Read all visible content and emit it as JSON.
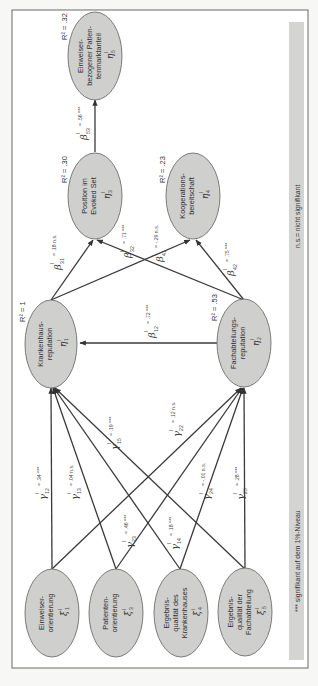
{
  "figure": {
    "orientation": "rotated-90-ccw",
    "legend": {
      "significance_note": "*** signifikant auf dem 1%-Niveau",
      "ns_note": "n.s.= nicht signifikant"
    },
    "nodes": {
      "xi1": {
        "line1": "Einweiser-",
        "line2": "orientierung",
        "line3": "",
        "symbol": "ξ",
        "sup": "l",
        "sub": "1"
      },
      "xi3": {
        "line1": "Patienten-",
        "line2": "orientierung",
        "line3": "",
        "symbol": "ξ",
        "sup": "l",
        "sub": "3"
      },
      "xi4": {
        "line1": "Ergebnis-",
        "line2": "qualität des",
        "line3": "Krankenhauses",
        "symbol": "ξ",
        "sup": "l",
        "sub": "4"
      },
      "xi5": {
        "line1": "Ergebnis-",
        "line2": "qualität der",
        "line3": "Fachabteilung",
        "symbol": "ξ",
        "sup": "l",
        "sub": "5"
      },
      "eta1": {
        "line1": "Krankenhaus-",
        "line2": "reputation",
        "symbol": "η",
        "sup": "l",
        "sub": "1",
        "r2": "R² = 1"
      },
      "eta2": {
        "line1": "Fachabteilungs-",
        "line2": "reputation",
        "symbol": "η",
        "sup": "l",
        "sub": "2",
        "r2": "R² = .53"
      },
      "eta3": {
        "line1": "Position im",
        "line2": "Evoked Set",
        "symbol": "η",
        "sup": "l",
        "sub": "3",
        "r2": "R² = .30"
      },
      "eta4": {
        "line1": "Kooperations-",
        "line2": "bereitschaft",
        "symbol": "η",
        "sup": "l",
        "sub": "4",
        "r2": "R² = .23"
      },
      "eta5": {
        "line1": "Einweiser-",
        "line2": "bezogener Patien-",
        "line3": "tenmarktanteil",
        "symbol": "η",
        "sup": "l",
        "sub": "5",
        "r2": "R² = .32"
      }
    },
    "paths": {
      "g12": {
        "sym": "γ",
        "sup": "l",
        "sub": "12",
        "value": "= .34 ***"
      },
      "g13": {
        "sym": "γ",
        "sup": "l",
        "sub": "13",
        "value": "= .04 n.s."
      },
      "g15": {
        "sym": "γ",
        "sup": "l",
        "sub": "15",
        "value": "= .19 ***"
      },
      "g23": {
        "sym": "γ",
        "sup": "l",
        "sub": "23",
        "value": "= .46 ***"
      },
      "g22": {
        "sym": "γ",
        "sup": "l",
        "sub": "22",
        "value": "= .12 n.s."
      },
      "g14": {
        "sym": "γ",
        "sup": "l",
        "sub": "14",
        "value": "= .18 ***"
      },
      "g24": {
        "sym": "γ",
        "sup": "l",
        "sub": "24",
        "value": "= -.01 n.s."
      },
      "g25": {
        "sym": "γ",
        "sup": "l",
        "sub": "25",
        "value": "= .28 ***"
      },
      "b12": {
        "sym": "β",
        "sup": "l",
        "sub": "12",
        "value": "= .72 ***"
      },
      "b31": {
        "sym": "β",
        "sup": "l",
        "sub": "31",
        "value": "= .18 n.s."
      },
      "b32": {
        "sym": "β",
        "sup": "l",
        "sub": "32",
        "value": "= .71 ***"
      },
      "b41": {
        "sym": "β",
        "sup": "l",
        "sub": "41",
        "value": "= -.29 n.s."
      },
      "b42": {
        "sym": "β",
        "sup": "l",
        "sub": "42",
        "value": "= .75 ***"
      },
      "b53": {
        "sym": "β",
        "sup": "l",
        "sub": "53",
        "value": "= .56 ***"
      }
    }
  }
}
